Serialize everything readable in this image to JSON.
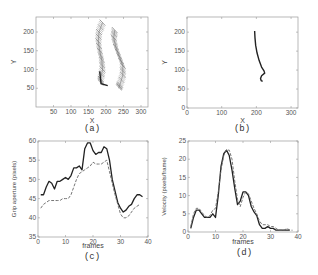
{
  "figure": {
    "panels": [
      {
        "id": "a",
        "caption": "(a)",
        "xlabel": "X",
        "ylabel": "Y"
      },
      {
        "id": "b",
        "caption": "(b)",
        "xlabel": "X",
        "ylabel": "Y"
      },
      {
        "id": "c",
        "caption": "(c)",
        "xlabel": "frames",
        "ylabel": "Grip aperture (pixels)"
      },
      {
        "id": "d",
        "caption": "(d)",
        "xlabel": "frames",
        "ylabel": "Velocity (pixels/frame)"
      }
    ]
  },
  "chart_data": [
    {
      "panel": "a",
      "type": "scatter",
      "title": "",
      "xlabel": "X",
      "ylabel": "Y",
      "xticks": [
        50,
        100,
        150,
        200,
        250,
        300
      ],
      "yticks": [
        50,
        100,
        150,
        200
      ],
      "xlim": [
        0,
        320
      ],
      "ylim": [
        0,
        240
      ],
      "description": "Many overlaid short hatch segments forming two slanted strands (finger trajectories)",
      "series": [
        {
          "name": "left strand",
          "points": [
            [
              190,
              225
            ],
            [
              180,
              200
            ],
            [
              178,
              175
            ],
            [
              182,
              150
            ],
            [
              188,
              125
            ],
            [
              190,
              100
            ],
            [
              185,
              75
            ],
            [
              185,
              62
            ]
          ]
        },
        {
          "name": "right strand",
          "points": [
            [
              225,
              205
            ],
            [
              222,
              185
            ],
            [
              228,
              160
            ],
            [
              238,
              135
            ],
            [
              248,
              110
            ],
            [
              248,
              85
            ],
            [
              240,
              60
            ],
            [
              236,
              50
            ]
          ]
        },
        {
          "name": "dark L segment",
          "points": [
            [
              182,
              95
            ],
            [
              186,
              62
            ],
            [
              205,
              57
            ]
          ]
        }
      ]
    },
    {
      "panel": "b",
      "type": "line",
      "title": "",
      "xlabel": "X",
      "ylabel": "Y",
      "xticks": [
        0,
        100,
        200,
        300
      ],
      "yticks": [
        0,
        50,
        100,
        150,
        200
      ],
      "xlim": [
        0,
        320
      ],
      "ylim": [
        0,
        240
      ],
      "series": [
        {
          "name": "trajectory",
          "points": [
            [
              195,
              203
            ],
            [
              196,
              185
            ],
            [
              198,
              165
            ],
            [
              202,
              145
            ],
            [
              208,
              125
            ],
            [
              215,
              108
            ],
            [
              222,
              98
            ],
            [
              224,
              92
            ],
            [
              215,
              85
            ],
            [
              212,
              78
            ],
            [
              214,
              72
            ],
            [
              218,
              70
            ]
          ]
        }
      ]
    },
    {
      "panel": "c",
      "type": "line",
      "title": "",
      "xlabel": "frames",
      "ylabel": "Grip aperture (pixels)",
      "xticks": [
        0,
        10,
        20,
        30,
        40
      ],
      "yticks": [
        35,
        40,
        45,
        50,
        55,
        60
      ],
      "xlim": [
        0,
        40
      ],
      "ylim": [
        35,
        60
      ],
      "series": [
        {
          "name": "solid",
          "style": "solid",
          "x": [
            1,
            2,
            3,
            4,
            5,
            6,
            7,
            8,
            9,
            10,
            11,
            12,
            13,
            14,
            15,
            16,
            17,
            18,
            19,
            20,
            21,
            22,
            23,
            24,
            25,
            26,
            27,
            28,
            29,
            30,
            31,
            32,
            33,
            34,
            35,
            36,
            37,
            38
          ],
          "values": [
            46,
            46,
            48,
            49.5,
            49,
            47.5,
            49.5,
            49.5,
            50,
            50.5,
            50,
            51,
            53,
            53,
            53.5,
            52.5,
            58,
            59.5,
            59.5,
            57.5,
            56.5,
            57,
            57,
            58.5,
            58,
            55,
            50,
            47,
            44,
            42.5,
            41.5,
            42,
            43,
            43.5,
            45,
            46,
            46,
            45.5
          ]
        },
        {
          "name": "dashed",
          "style": "dashed",
          "x": [
            1,
            2,
            3,
            4,
            5,
            6,
            7,
            8,
            9,
            10,
            11,
            12,
            13,
            14,
            15,
            16,
            17,
            18,
            19,
            20,
            21,
            22,
            23,
            24,
            25,
            26,
            27,
            28,
            29,
            30,
            31,
            32,
            33,
            34,
            35,
            36,
            37
          ],
          "values": [
            42.5,
            43.5,
            44,
            44.5,
            44.5,
            44.5,
            44.5,
            44.5,
            45,
            45,
            45,
            46,
            48,
            50,
            51.5,
            52,
            52.5,
            53,
            53.5,
            54.5,
            54,
            54,
            54,
            54.5,
            55,
            52,
            49,
            46,
            43.5,
            41,
            40,
            40,
            40.5,
            41.5,
            42.5,
            43,
            43.5
          ]
        }
      ]
    },
    {
      "panel": "d",
      "type": "line",
      "title": "",
      "xlabel": "frames",
      "ylabel": "Velocity (pixels/frame)",
      "xticks": [
        0,
        10,
        20,
        30,
        40
      ],
      "yticks": [
        0,
        5,
        10,
        15,
        20,
        25
      ],
      "xlim": [
        0,
        40
      ],
      "ylim": [
        0,
        25
      ],
      "series": [
        {
          "name": "solid",
          "style": "solid",
          "x": [
            1,
            2,
            3,
            4,
            5,
            6,
            7,
            8,
            9,
            10,
            11,
            12,
            13,
            14,
            15,
            16,
            17,
            18,
            19,
            20,
            21,
            22,
            23,
            24,
            25,
            26,
            27,
            28,
            29,
            30,
            31,
            32,
            33,
            34,
            35,
            36,
            37
          ],
          "values": [
            1,
            4,
            6,
            6,
            5,
            4,
            4,
            4,
            5,
            4,
            10,
            18,
            21.5,
            22.5,
            21,
            17,
            12,
            7.5,
            8.5,
            11,
            11,
            10,
            7,
            5.5,
            4.5,
            2,
            1,
            1,
            1.5,
            1,
            1,
            0.5,
            0.5,
            0.5,
            0.5,
            0.5,
            0.5
          ]
        },
        {
          "name": "dashed",
          "style": "dashed",
          "x": [
            1,
            2,
            3,
            4,
            5,
            6,
            7,
            8,
            9,
            10,
            11,
            12,
            13,
            14,
            15,
            16,
            17,
            18,
            19,
            20,
            21,
            22,
            23,
            24,
            25,
            26,
            27,
            28,
            29,
            30,
            31,
            32,
            33,
            34,
            35,
            36,
            37,
            38
          ],
          "values": [
            1.5,
            5,
            6.5,
            6.5,
            5.5,
            4.5,
            4,
            4.5,
            6,
            6.5,
            11,
            17,
            21,
            22.5,
            22.5,
            20,
            14,
            9,
            7,
            9.5,
            11,
            10.5,
            8.5,
            6.5,
            5,
            3,
            2,
            2,
            2,
            1.5,
            1.5,
            1,
            0.5,
            0.5,
            0.5,
            1,
            0.5,
            0.5
          ]
        }
      ]
    }
  ]
}
